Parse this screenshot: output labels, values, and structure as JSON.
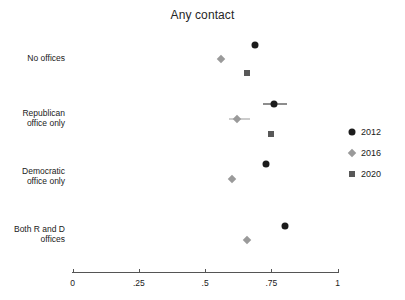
{
  "chart_data": {
    "type": "scatter",
    "title": "Any contact",
    "xlabel": "",
    "ylabel": "",
    "xlim": [
      0,
      1
    ],
    "xticks": [
      0,
      0.25,
      0.5,
      0.75,
      1
    ],
    "xtick_labels": [
      "0",
      ".25",
      ".5",
      ".75",
      "1"
    ],
    "grid": false,
    "legend_position": "right",
    "categories": [
      "No offices",
      "Republican office only",
      "Democratic office only",
      "Both R and D offices"
    ],
    "series": [
      {
        "name": "2012",
        "marker": "circle",
        "color": "#1c1c1c",
        "values": [
          0.69,
          0.76,
          0.73,
          0.8
        ],
        "ci_low": [
          null,
          0.72,
          null,
          null
        ],
        "ci_high": [
          null,
          0.81,
          null,
          null
        ]
      },
      {
        "name": "2016",
        "marker": "diamond",
        "color": "#9a9a9a",
        "values": [
          0.56,
          0.62,
          0.6,
          0.66
        ],
        "ci_low": [
          null,
          0.59,
          null,
          null
        ],
        "ci_high": [
          null,
          0.67,
          null,
          null
        ]
      },
      {
        "name": "2020",
        "marker": "square",
        "color": "#585858",
        "values": [
          0.66,
          0.75,
          null,
          null
        ],
        "ci_low": [
          null,
          null,
          null,
          null
        ],
        "ci_high": [
          null,
          null,
          null,
          null
        ]
      }
    ]
  },
  "axis": {
    "tick_0": "0",
    "tick_25": ".25",
    "tick_5": ".5",
    "tick_75": ".75",
    "tick_1": "1"
  },
  "categories": {
    "row1": "No offices",
    "row2_line1": "Republican",
    "row2_line2": "office only",
    "row3_line1": "Democratic",
    "row3_line2": "office only",
    "row4_line1": "Both R and D",
    "row4_line2": "offices"
  },
  "legend": {
    "item1": "2012",
    "item2": "2016",
    "item3": "2020"
  },
  "title": "Any contact"
}
